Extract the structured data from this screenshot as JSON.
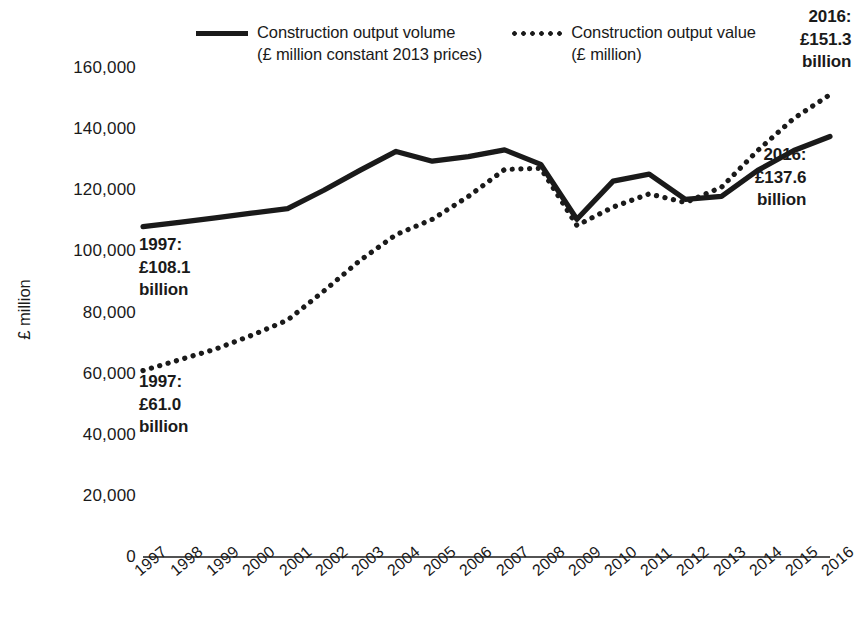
{
  "chart_data": {
    "type": "line",
    "title": "",
    "xlabel": "",
    "ylabel": "£ million",
    "ylim": [
      0,
      160000
    ],
    "yticks": [
      0,
      20000,
      40000,
      60000,
      80000,
      100000,
      120000,
      140000,
      160000
    ],
    "ytick_labels": [
      "0",
      "20,000",
      "40,000",
      "60,000",
      "80,000",
      "100,000",
      "120,000",
      "140,000",
      "160,000"
    ],
    "grid": false,
    "legend_position": "top-center",
    "categories": [
      "1997",
      "1998",
      "1999",
      "2000",
      "2001",
      "2002",
      "2003",
      "2004",
      "2005",
      "2006",
      "2007",
      "2008",
      "2009",
      "2010",
      "2011",
      "2012",
      "2013",
      "2014",
      "2015",
      "2016"
    ],
    "series": [
      {
        "name": "Construction output volume",
        "unit": "£ million constant 2013 prices",
        "style": "solid",
        "color": "#1a1a1a",
        "values": [
          108100,
          109500,
          111000,
          112500,
          114000,
          120000,
          126500,
          132700,
          129500,
          131000,
          133200,
          128500,
          110500,
          123000,
          125300,
          117000,
          118000,
          126500,
          133000,
          137600
        ]
      },
      {
        "name": "Construction output value",
        "unit": "£ million",
        "style": "dotted",
        "color": "#1a1a1a",
        "values": [
          61000,
          64500,
          68000,
          72500,
          77500,
          87000,
          97000,
          105500,
          110500,
          118000,
          126800,
          127200,
          108500,
          114500,
          118800,
          116000,
          121000,
          133000,
          143500,
          151300
        ]
      }
    ],
    "annotations": [
      {
        "id": "volume-start",
        "lines": [
          "1997:",
          "£108.1",
          "billion"
        ],
        "align": "left",
        "x": 139,
        "y": 234
      },
      {
        "id": "value-start",
        "lines": [
          "1997:",
          "£61.0",
          "billion"
        ],
        "align": "left",
        "x": 139,
        "y": 371
      },
      {
        "id": "value-end",
        "lines": [
          "2016:",
          "£151.3",
          "billion"
        ],
        "align": "right",
        "x": 800,
        "y": 6
      },
      {
        "id": "volume-end",
        "lines": [
          "2016:",
          "£137.6",
          "billion"
        ],
        "align": "right",
        "x": 755,
        "y": 144
      }
    ]
  },
  "legend": {
    "items": [
      {
        "marker": "solid-line",
        "line1": "Construction output volume",
        "line2": "(£ million constant 2013 prices)"
      },
      {
        "marker": "dotted-line",
        "line1": "Construction output value",
        "line2": "(£ million)"
      }
    ]
  },
  "colors": {
    "ink": "#1a1a1a",
    "background": "#ffffff"
  }
}
